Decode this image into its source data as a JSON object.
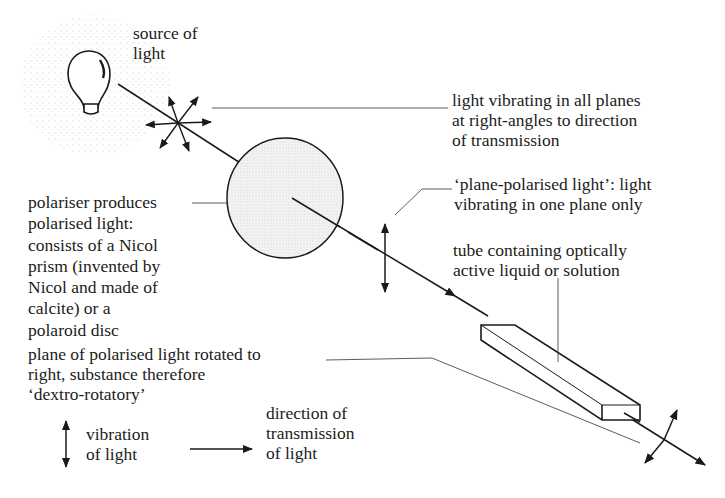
{
  "labels": {
    "source": "source of\nlight",
    "all_planes": "light vibrating in all planes\nat right-angles to direction\nof transmission",
    "plane_polarised": "‘plane-polarised light’: light\nvibrating in one plane only",
    "tube": "tube containing optically\nactive liquid or solution",
    "polariser": "polariser produces\npolarised light:\nconsists of a Nicol\nprism (invented by\nNicol and made of\ncalcite) or a\npolaroid disc",
    "rotated": "plane of polarised light rotated to\nright, substance therefore\n‘dextro-rotatory’",
    "legend_vibration": "vibration\nof light",
    "legend_direction": "direction of\ntransmission\nof light"
  },
  "colors": {
    "ink": "#1a1a1a",
    "disc_fill": "#ececec",
    "stipple": "#b8b8b8"
  }
}
